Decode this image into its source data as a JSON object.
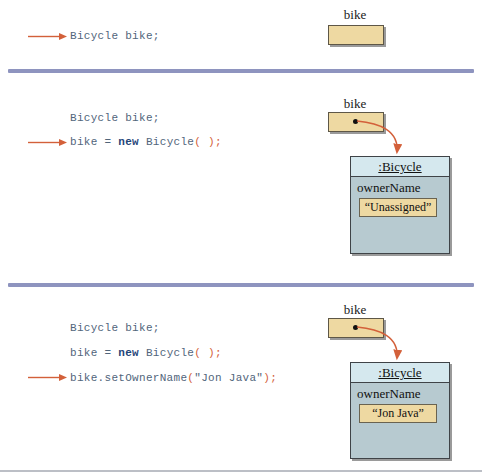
{
  "palette": {
    "code_text": "#51657b",
    "keyword": "#1f4579",
    "paren_orange": "#d3603a",
    "arrow_orange": "#d3603a",
    "divider": "#8e94bf",
    "var_box_fill": "#eed9a2",
    "object_header_fill": "#d5e8ee",
    "object_body_fill": "#b7cad0"
  },
  "sections": [
    {
      "code": {
        "decl": "Bicycle bike;"
      },
      "diagram": {
        "var_label": "bike"
      }
    },
    {
      "code": {
        "decl": "Bicycle bike;",
        "assign": {
          "pre": "bike = ",
          "kw": "new",
          "mid": " Bicycle",
          "paren": "( );"
        }
      },
      "diagram": {
        "var_label": "bike",
        "object": {
          "class_label": ":Bicycle",
          "field_label": "ownerName",
          "field_value": "“Unassigned”"
        }
      }
    },
    {
      "code": {
        "decl": "Bicycle bike;",
        "assign": {
          "pre": "bike = ",
          "kw": "new",
          "mid": " Bicycle",
          "paren": "( );"
        },
        "call": {
          "pre": "bike.setOwnerName",
          "open_paren": "(",
          "arg": "\"Jon Java\"",
          "close_paren": ");"
        }
      },
      "diagram": {
        "var_label": "bike",
        "object": {
          "class_label": ":Bicycle",
          "field_label": "ownerName",
          "field_value": "“Jon Java”"
        }
      }
    }
  ]
}
